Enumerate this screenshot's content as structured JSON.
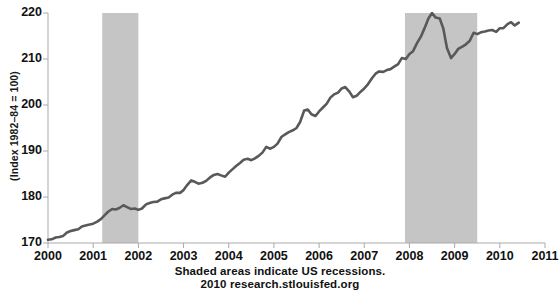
{
  "chart_data": {
    "type": "line",
    "title": "",
    "xlabel": "",
    "ylabel": "(Index 1982–84 = 100)",
    "xlim": [
      2000,
      2011
    ],
    "ylim": [
      170,
      220
    ],
    "grid": false,
    "legend": "none",
    "line_color": "#595959",
    "shade_color": "#c5c5c5",
    "axis_color": "#aaaaaa",
    "xticks": [
      "2000",
      "2001",
      "2002",
      "2003",
      "2004",
      "2005",
      "2006",
      "2007",
      "2008",
      "2009",
      "2010",
      "2011"
    ],
    "yticks": [
      "170",
      "180",
      "190",
      "200",
      "210",
      "220"
    ],
    "shaded_regions": [
      {
        "label": "US recession 2001",
        "start": 2001.2,
        "end": 2002.0
      },
      {
        "label": "US recession 2007-2009",
        "start": 2007.9,
        "end": 2009.5
      }
    ],
    "series": [
      {
        "name": "Consumer Price Index",
        "x": [
          2000.0,
          2000.08,
          2000.17,
          2000.25,
          2000.33,
          2000.42,
          2000.5,
          2000.58,
          2000.67,
          2000.75,
          2000.83,
          2000.92,
          2001.0,
          2001.08,
          2001.17,
          2001.25,
          2001.33,
          2001.42,
          2001.5,
          2001.58,
          2001.67,
          2001.75,
          2001.83,
          2001.92,
          2002.0,
          2002.08,
          2002.17,
          2002.25,
          2002.33,
          2002.42,
          2002.5,
          2002.58,
          2002.67,
          2002.75,
          2002.83,
          2002.92,
          2003.0,
          2003.08,
          2003.17,
          2003.25,
          2003.33,
          2003.42,
          2003.5,
          2003.58,
          2003.67,
          2003.75,
          2003.83,
          2003.92,
          2004.0,
          2004.08,
          2004.17,
          2004.25,
          2004.33,
          2004.42,
          2004.5,
          2004.58,
          2004.67,
          2004.75,
          2004.83,
          2004.92,
          2005.0,
          2005.08,
          2005.17,
          2005.25,
          2005.33,
          2005.42,
          2005.5,
          2005.58,
          2005.67,
          2005.75,
          2005.83,
          2005.92,
          2006.0,
          2006.08,
          2006.17,
          2006.25,
          2006.33,
          2006.42,
          2006.5,
          2006.58,
          2006.67,
          2006.75,
          2006.83,
          2006.92,
          2007.0,
          2007.08,
          2007.17,
          2007.25,
          2007.33,
          2007.42,
          2007.5,
          2007.58,
          2007.67,
          2007.75,
          2007.83,
          2007.92,
          2008.0,
          2008.08,
          2008.17,
          2008.25,
          2008.33,
          2008.42,
          2008.5,
          2008.58,
          2008.67,
          2008.75,
          2008.83,
          2008.92,
          2009.0,
          2009.08,
          2009.17,
          2009.25,
          2009.33,
          2009.42,
          2009.5,
          2009.58,
          2009.67,
          2009.75,
          2009.83,
          2009.92,
          2010.0,
          2010.08,
          2010.17,
          2010.25,
          2010.33,
          2010.42
        ],
        "values": [
          170.7,
          170.8,
          171.2,
          171.3,
          171.5,
          172.3,
          172.6,
          172.8,
          173.0,
          173.6,
          173.8,
          174.0,
          174.2,
          174.6,
          175.2,
          176.0,
          176.8,
          177.4,
          177.3,
          177.6,
          178.2,
          177.8,
          177.4,
          177.5,
          177.2,
          177.5,
          178.4,
          178.7,
          178.9,
          179.0,
          179.5,
          179.7,
          179.9,
          180.5,
          180.9,
          180.9,
          181.5,
          182.6,
          183.6,
          183.3,
          182.9,
          183.1,
          183.5,
          184.2,
          184.8,
          185.0,
          184.7,
          184.4,
          185.3,
          186.0,
          186.8,
          187.4,
          188.1,
          188.3,
          188.0,
          188.4,
          189.0,
          189.7,
          190.9,
          190.5,
          190.9,
          191.6,
          193.1,
          193.6,
          194.1,
          194.5,
          195.0,
          196.3,
          198.8,
          199.0,
          198.0,
          197.6,
          198.6,
          199.4,
          200.3,
          201.6,
          202.3,
          202.7,
          203.6,
          203.9,
          202.9,
          201.7,
          202.0,
          202.9,
          203.6,
          204.5,
          205.8,
          206.8,
          207.3,
          207.2,
          207.6,
          207.8,
          208.4,
          208.9,
          210.2,
          210.0,
          211.1,
          211.7,
          213.5,
          214.8,
          216.6,
          218.8,
          220.0,
          219.0,
          218.8,
          216.6,
          212.4,
          210.2,
          211.1,
          212.2,
          212.7,
          213.2,
          213.9,
          215.7,
          215.4,
          215.8,
          216.0,
          216.2,
          216.3,
          215.9,
          216.7,
          216.7,
          217.6,
          218.0,
          217.3,
          217.9
        ]
      }
    ],
    "footer_line1": "Shaded areas indicate US recessions.",
    "footer_line2": "2010 research.stlouisfed.org"
  }
}
